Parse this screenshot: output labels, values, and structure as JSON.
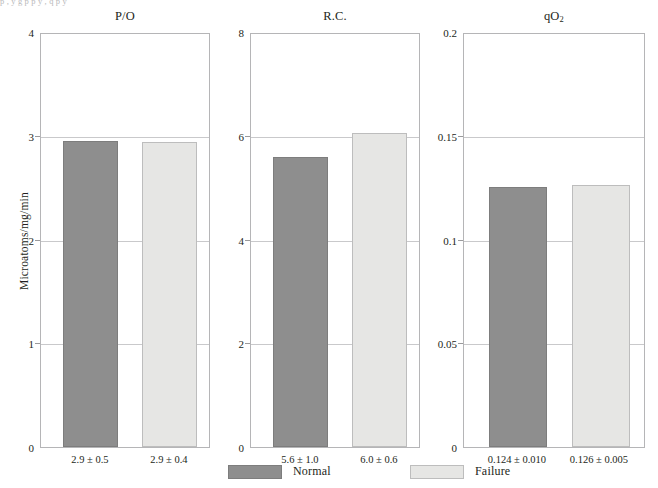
{
  "top_clipped_text": "p    , y      g                                      p  p y                                                  , q   p y",
  "axis": {
    "ylabel": "Microatoms/mg/min"
  },
  "legend": {
    "position": "bottom",
    "items": [
      {
        "label": "Normal",
        "color": "#8e8e8e"
      },
      {
        "label": "Failure",
        "color": "#e6e6e4"
      }
    ]
  },
  "chart_data": {
    "type": "bar",
    "title": "",
    "ylabel": "Microatoms/mg/min",
    "xlabel": "",
    "grid": true,
    "legend_position": "bottom",
    "categories": [
      "Normal",
      "Failure"
    ],
    "panels": [
      {
        "title": "P/O",
        "ylim": [
          0,
          4
        ],
        "yticks": [
          0,
          1,
          2,
          3,
          4
        ],
        "ytick_labels": [
          "0",
          "1",
          "2",
          "3",
          "4"
        ],
        "values": [
          2.95,
          2.94
        ],
        "errors": [
          0.5,
          0.4
        ],
        "bar_labels": [
          "2.9 ± 0.5",
          "2.9 ± 0.4"
        ]
      },
      {
        "title": "R.C.",
        "ylim": [
          0,
          8
        ],
        "yticks": [
          0,
          2,
          4,
          6,
          8
        ],
        "ytick_labels": [
          "0",
          "2",
          "4",
          "6",
          "8"
        ],
        "values": [
          5.6,
          6.05
        ],
        "errors": [
          1.0,
          0.6
        ],
        "bar_labels": [
          "5.6 ± 1.0",
          "6.0 ± 0.6"
        ]
      },
      {
        "title": "qO2",
        "title_base": "qO",
        "title_sub": "2",
        "ylim": [
          0,
          0.2
        ],
        "yticks": [
          0,
          0.05,
          0.1,
          0.15,
          0.2
        ],
        "ytick_labels": [
          "0",
          "0.05",
          "0.1",
          "0.15",
          "0.2"
        ],
        "values": [
          0.1255,
          0.1265
        ],
        "errors": [
          0.01,
          0.005
        ],
        "bar_labels": [
          "0.124 ± 0.010",
          "0.126 ± 0.005"
        ]
      }
    ]
  }
}
